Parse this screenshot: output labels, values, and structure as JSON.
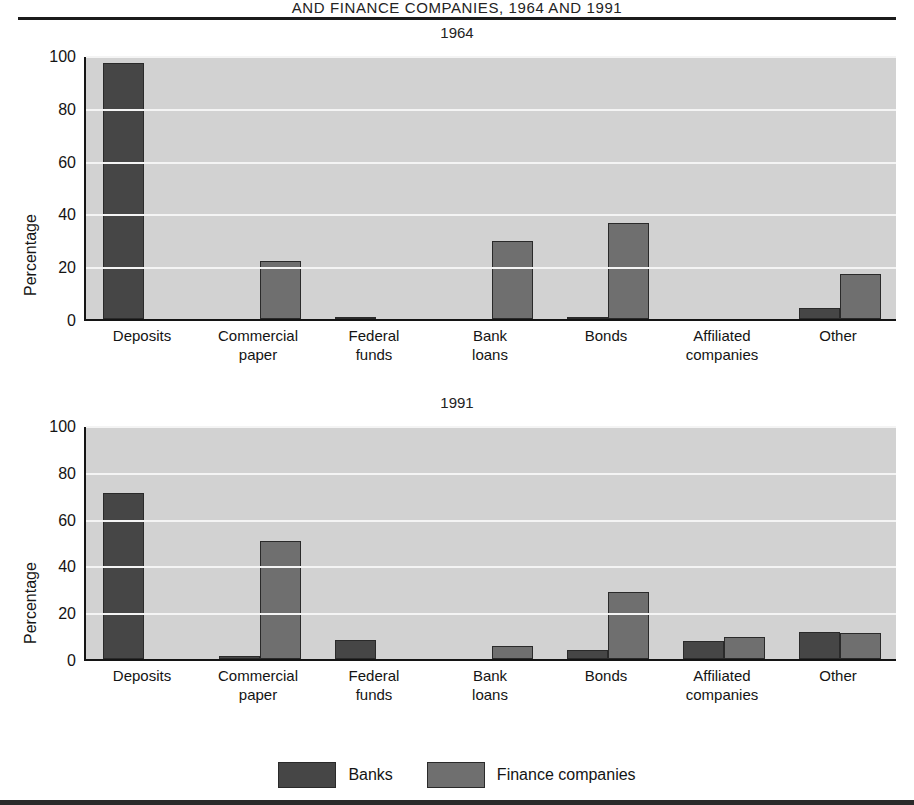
{
  "figure": {
    "title_visible_line": "AND FINANCE COMPANIES, 1964 AND 1991",
    "ylabel": "Percentage"
  },
  "legend": {
    "position": "bottom-center",
    "items": [
      {
        "label": "Banks",
        "color": "#464646",
        "swatch": "banks-swatch"
      },
      {
        "label": "Finance companies",
        "color": "#6f6f6f",
        "swatch": "finance-companies-swatch"
      }
    ]
  },
  "axis": {
    "yticks": [
      "0",
      "20",
      "40",
      "60",
      "80",
      "100"
    ],
    "ymin": 0,
    "ymax": 100
  },
  "categories": [
    {
      "line1": "Deposits",
      "line2": ""
    },
    {
      "line1": "Commercial",
      "line2": "paper"
    },
    {
      "line1": "Federal",
      "line2": "funds"
    },
    {
      "line1": "Bank",
      "line2": "loans"
    },
    {
      "line1": "Bonds",
      "line2": ""
    },
    {
      "line1": "Affiliated",
      "line2": "companies"
    },
    {
      "line1": "Other",
      "line2": ""
    }
  ],
  "panels": [
    {
      "id": "1964",
      "subtitle": "1964"
    },
    {
      "id": "1991",
      "subtitle": "1991"
    }
  ],
  "colors": {
    "banks": "#464646",
    "finance": "#6f6f6f",
    "plot_background": "#d2d2d2",
    "gridline": "#f4f4f4",
    "axis": "#141414",
    "page_background": "#ffffff"
  },
  "chart_data": [
    {
      "type": "bar",
      "title": "1964",
      "xlabel": "",
      "ylabel": "Percentage",
      "ylim": [
        0,
        100
      ],
      "yticks": [
        0,
        20,
        40,
        60,
        80,
        100
      ],
      "grid": true,
      "legend_position": "bottom-center",
      "categories": [
        "Deposits",
        "Commercial paper",
        "Federal funds",
        "Bank loans",
        "Bonds",
        "Affiliated companies",
        "Other"
      ],
      "series": [
        {
          "name": "Banks",
          "values": [
            97,
            0,
            0.5,
            0,
            0.7,
            0,
            4
          ]
        },
        {
          "name": "Finance companies",
          "values": [
            0,
            22,
            0,
            29.5,
            36.5,
            0,
            17
          ]
        }
      ]
    },
    {
      "type": "bar",
      "title": "1991",
      "xlabel": "",
      "ylabel": "Percentage",
      "ylim": [
        0,
        100
      ],
      "yticks": [
        0,
        20,
        40,
        60,
        80,
        100
      ],
      "grid": true,
      "legend_position": "bottom-center",
      "categories": [
        "Deposits",
        "Commercial paper",
        "Federal funds",
        "Bank loans",
        "Bonds",
        "Affiliated companies",
        "Other"
      ],
      "series": [
        {
          "name": "Banks",
          "values": [
            71,
            1.5,
            8,
            0,
            4,
            7.5,
            11.5
          ]
        },
        {
          "name": "Finance companies",
          "values": [
            0,
            50.5,
            0,
            5.5,
            28.5,
            9.5,
            11
          ]
        }
      ]
    }
  ]
}
